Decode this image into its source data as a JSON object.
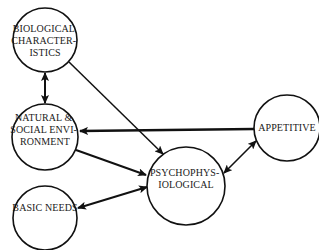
{
  "diagram": {
    "nodes": [
      {
        "id": "biological",
        "lines": [
          "BIOLOGICAL",
          "CHARACTER-",
          "ISTICS"
        ],
        "cx": 45,
        "cy": 40,
        "r": 32
      },
      {
        "id": "natural-social",
        "lines": [
          "NATURAL &",
          "SOCIAL ENVI-",
          "RONMENT"
        ],
        "cx": 45,
        "cy": 137,
        "r": 33
      },
      {
        "id": "basic-needs",
        "lines": [
          "BASIC NEEDS"
        ],
        "cx": 45,
        "cy": 218,
        "r": 32
      },
      {
        "id": "psychophysiological",
        "lines": [
          "PSYCHOPHYS-",
          "IOLOGICAL"
        ],
        "cx": 186,
        "cy": 186,
        "r": 39
      },
      {
        "id": "appetitive",
        "lines": [
          "APPETITIVE"
        ],
        "cx": 287,
        "cy": 128,
        "r": 33
      }
    ],
    "edges": [
      {
        "from": "biological",
        "to": "natural-social",
        "type": "bidirectional"
      },
      {
        "from": "biological",
        "to": "psychophysiological",
        "type": "directed"
      },
      {
        "from": "appetitive",
        "to": "natural-social",
        "type": "directed"
      },
      {
        "from": "natural-social",
        "to": "psychophysiological",
        "type": "directed"
      },
      {
        "from": "basic-needs",
        "to": "psychophysiological",
        "type": "bidirectional"
      },
      {
        "from": "psychophysiological",
        "to": "appetitive",
        "type": "bidirectional"
      }
    ]
  }
}
